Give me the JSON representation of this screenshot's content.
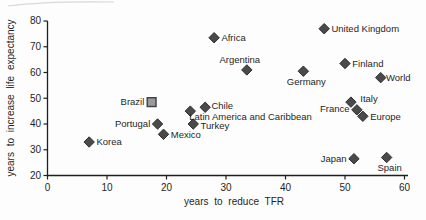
{
  "chart_data": {
    "type": "scatter",
    "title": "",
    "xlabel": "years to reduce TFR",
    "ylabel": "years to increase life expectancy",
    "xlim": [
      0,
      60
    ],
    "ylim": [
      20,
      80
    ],
    "xticks": [
      0,
      10,
      20,
      30,
      40,
      50,
      60
    ],
    "yticks": [
      20,
      30,
      40,
      50,
      60,
      70,
      80
    ],
    "grid": false,
    "legend": "none",
    "axis_color": "#1f1f1f",
    "marker_styles": {
      "diamond_fill": "#4a4a4a",
      "diamond_stroke": "#2e2e2e",
      "square_fill": "#9a9a9a",
      "square_stroke": "#3f3f3f"
    },
    "points": [
      {
        "label": "Korea",
        "x": 7,
        "y": 33,
        "marker": "diamond",
        "label_pos": "right"
      },
      {
        "label": "Portugal",
        "x": 18.5,
        "y": 40,
        "marker": "diamond",
        "label_pos": "left"
      },
      {
        "label": "Mexico",
        "x": 19.5,
        "y": 36,
        "marker": "diamond",
        "label_pos": "right"
      },
      {
        "label": "Brazil",
        "x": 17.5,
        "y": 48.5,
        "marker": "square",
        "label_pos": "left"
      },
      {
        "label": "Turkey",
        "x": 24.5,
        "y": 40,
        "marker": "diamond",
        "label_pos": "right",
        "dy": 2
      },
      {
        "label": "Latin America and Caribbean",
        "x": 24,
        "y": 45,
        "marker": "diamond",
        "label_pos": "below-right"
      },
      {
        "label": "Chile",
        "x": 26.5,
        "y": 46.5,
        "marker": "diamond",
        "label_pos": "right",
        "dx": -1,
        "dy": -2
      },
      {
        "label": "Africa",
        "x": 28,
        "y": 73.5,
        "marker": "diamond",
        "label_pos": "right"
      },
      {
        "label": "Argentina",
        "x": 33.5,
        "y": 61,
        "marker": "diamond",
        "label_pos": "above",
        "dx": -7
      },
      {
        "label": "Germany",
        "x": 43,
        "y": 60.5,
        "marker": "diamond",
        "label_pos": "below",
        "dx": 3
      },
      {
        "label": "United Kingdom",
        "x": 46.5,
        "y": 77,
        "marker": "diamond",
        "label_pos": "right"
      },
      {
        "label": "Finland",
        "x": 50,
        "y": 63.5,
        "marker": "diamond",
        "label_pos": "right"
      },
      {
        "label": "World",
        "x": 56,
        "y": 58,
        "marker": "diamond",
        "label_pos": "right",
        "dx": -2
      },
      {
        "label": "Italy",
        "x": 51,
        "y": 48.5,
        "marker": "diamond",
        "label_pos": "right",
        "dx": 2,
        "dy": -3
      },
      {
        "label": "France",
        "x": 52,
        "y": 45.5,
        "marker": "diamond",
        "label_pos": "left",
        "dy": -1
      },
      {
        "label": "Europe",
        "x": 53,
        "y": 43,
        "marker": "diamond",
        "label_pos": "right"
      },
      {
        "label": "Japan",
        "x": 51.5,
        "y": 26.5,
        "marker": "diamond",
        "label_pos": "left"
      },
      {
        "label": "Spain",
        "x": 57,
        "y": 27,
        "marker": "diamond",
        "label_pos": "below",
        "dx": 3
      }
    ]
  }
}
